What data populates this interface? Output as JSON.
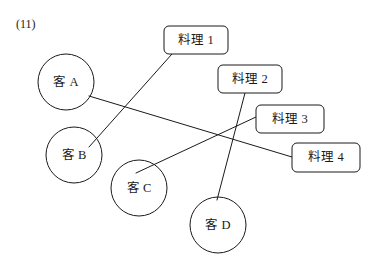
{
  "page": {
    "question_number": "(11)",
    "width": 374,
    "height": 272,
    "background_color": "#ffffff",
    "ink_color": "#1a1a1a"
  },
  "diagram": {
    "type": "matching-diagram",
    "left_nodes": [
      {
        "id": "guest-a",
        "label": "客 A",
        "shape": "circle",
        "cx": 66,
        "cy": 82,
        "r": 28
      },
      {
        "id": "guest-b",
        "label": "客 B",
        "shape": "circle",
        "cx": 74,
        "cy": 155,
        "r": 28
      },
      {
        "id": "guest-c",
        "label": "客 C",
        "shape": "circle",
        "cx": 139,
        "cy": 188,
        "r": 28
      },
      {
        "id": "guest-d",
        "label": "客 D",
        "shape": "circle",
        "cx": 218,
        "cy": 225,
        "r": 28
      }
    ],
    "right_nodes": [
      {
        "id": "dish-1",
        "label": "料理 1",
        "shape": "rounded-rect",
        "x": 164,
        "y": 26,
        "w": 64,
        "h": 28
      },
      {
        "id": "dish-2",
        "label": "料理 2",
        "shape": "rounded-rect",
        "x": 218,
        "y": 65,
        "w": 64,
        "h": 28
      },
      {
        "id": "dish-3",
        "label": "料理 3",
        "shape": "rounded-rect",
        "x": 256,
        "y": 105,
        "w": 68,
        "h": 28
      },
      {
        "id": "dish-4",
        "label": "料理 4",
        "shape": "rounded-rect",
        "x": 292,
        "y": 143,
        "w": 68,
        "h": 29
      }
    ],
    "edges": [
      {
        "id": "edge-guest-a-dish-4",
        "from": "guest-a",
        "to": "dish-4",
        "x1": 89,
        "y1": 96,
        "x2": 292,
        "y2": 157
      },
      {
        "id": "edge-guest-b-dish-1",
        "from": "guest-b",
        "to": "dish-1",
        "x1": 89,
        "y1": 147,
        "x2": 172,
        "y2": 54
      },
      {
        "id": "edge-guest-c-dish-3",
        "from": "guest-c",
        "to": "dish-3",
        "x1": 136,
        "y1": 173,
        "x2": 256,
        "y2": 117
      },
      {
        "id": "edge-guest-d-dish-2",
        "from": "guest-d",
        "to": "dish-2",
        "x1": 217,
        "y1": 200,
        "x2": 245,
        "y2": 93
      }
    ]
  }
}
